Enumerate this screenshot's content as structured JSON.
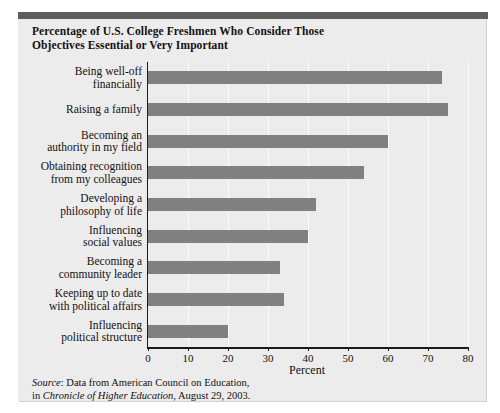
{
  "figure": {
    "title": "Percentage of U.S. College Freshmen Who Consider Those Objectives Essential or Very Important",
    "title_line1": "Percentage of U.S. College Freshmen Who Consider Those",
    "title_line2": "Objectives Essential or Very Important",
    "source_prefix": "Source",
    "source_line1_rest": ": Data from American Council on Education,",
    "source_line2_lead": "in ",
    "source_line2_italic": "Chronicle of Higher Education",
    "source_line2_rest": ", August 29, 2003.",
    "colors": {
      "bar": "#808080",
      "panel_background": "#ececed",
      "top_rule": "#5d5d5d",
      "axis": "#1a1a1a",
      "gridline": "#fbfbfb"
    }
  },
  "chart_data": {
    "type": "bar",
    "orientation": "horizontal",
    "title": "Percentage of U.S. College Freshmen Who Consider Those Objectives Essential or Very Important",
    "xlabel": "Percent",
    "ylabel": "",
    "xlim": [
      0,
      80
    ],
    "xticks": [
      0,
      10,
      20,
      30,
      40,
      50,
      60,
      70,
      80
    ],
    "xtick_labels": [
      "0",
      "10",
      "20",
      "30",
      "40",
      "50",
      "60",
      "70",
      "80"
    ],
    "grid": true,
    "legend": null,
    "categories": [
      "Being well-off financially",
      "Raising a family",
      "Becoming an authority in my field",
      "Obtaining recognition from my colleagues",
      "Developing a philosophy of life",
      "Influencing social values",
      "Becoming a community leader",
      "Keeping up to date with political affairs",
      "Influencing political structure"
    ],
    "category_lines": [
      [
        "Being well-off",
        "financially"
      ],
      [
        "Raising a family"
      ],
      [
        "Becoming an",
        "authority in my field"
      ],
      [
        "Obtaining recognition",
        "from my colleagues"
      ],
      [
        "Developing a",
        "philosophy of life"
      ],
      [
        "Influencing",
        "social values"
      ],
      [
        "Becoming a",
        "community leader"
      ],
      [
        "Keeping up to date",
        "with political affairs"
      ],
      [
        "Influencing",
        "political structure"
      ]
    ],
    "values": [
      73.5,
      75,
      60,
      54,
      42,
      40,
      33,
      34,
      20
    ]
  }
}
